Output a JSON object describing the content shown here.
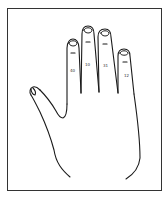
{
  "figure": {
    "type": "hand-outline-illustration",
    "stroke_color": "#1a1a1a",
    "border_color": "#333333",
    "background": "#ffffff",
    "finger_labels": [
      {
        "finger": "index",
        "text": "40"
      },
      {
        "finger": "middle",
        "text": "10"
      },
      {
        "finger": "ring",
        "text": "31"
      },
      {
        "finger": "little",
        "text": "12"
      }
    ]
  }
}
